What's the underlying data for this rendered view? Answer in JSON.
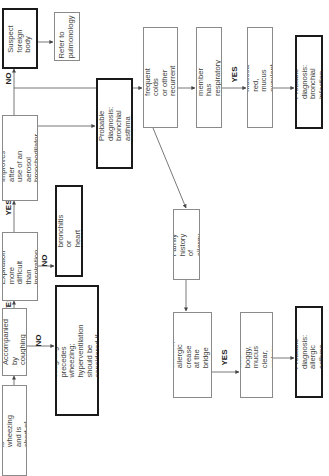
{
  "diagram": {
    "orientation": "rotated-90-ccw",
    "nodes": {
      "start": {
        "text": "\"My child is wheezing\nand is short of breath\""
      },
      "coughing": {
        "text": "Accompanied by\ncoughing"
      },
      "expiration": {
        "text": "Expiration more\ndifficult than\ninspiration"
      },
      "improves": {
        "text": "Improves after\nuse of an aerosol\nbronchodilator"
      },
      "foreign_body": {
        "text": "Suspect\nforeign body"
      },
      "pulmonology": {
        "text": "Refer to\npulmonology"
      },
      "dx_bronchial_asthma": {
        "text": "Probable diagnosis:\nbronchial asthma"
      },
      "bronchitis_heart": {
        "text": "Suspect bronchitis or\nheart disease"
      },
      "bronchitis_cough": {
        "text": "Suspect bronchitis if coughing\nprecedes wheezing;\nhyperventilation should be\nconsidered if there is no cough"
      },
      "history_colds": {
        "text": "History of frequent colds\nor other recurrent\nrespiratory"
      },
      "family_infection": {
        "text": "Family member has\nrespiratory infection"
      },
      "mucosa_red": {
        "text": "Mucosa red, mucus\npurulent"
      },
      "dx_bronchial_infection": {
        "text": "Probable diagnosis:\nbronchial infection"
      },
      "family_allergy": {
        "text": "Family history of\nallergy"
      },
      "allergic_shiners": {
        "text": "Allergic shiners,\nallergic crease at the\nbridge of the nose"
      },
      "mucosa_pale": {
        "text": "Mucosa pale and\nboggy, mucus clear,\nwatery, and profuse"
      },
      "dx_allergic_asthma": {
        "text": "Probable diagnosis:\nallergic asthma"
      }
    },
    "edge_labels": {
      "coughing_yes": "YES",
      "coughing_no": "NO",
      "expiration_yes": "YES",
      "expiration_no": "NO",
      "improves_no": "NO",
      "family_infection_yes": "YES",
      "allergic_shiners_yes": "YES"
    },
    "colors": {
      "line": "#555555",
      "thick_border": "#1a1a1a",
      "thin_border": "#8a8a8a",
      "text": "#444444"
    }
  }
}
